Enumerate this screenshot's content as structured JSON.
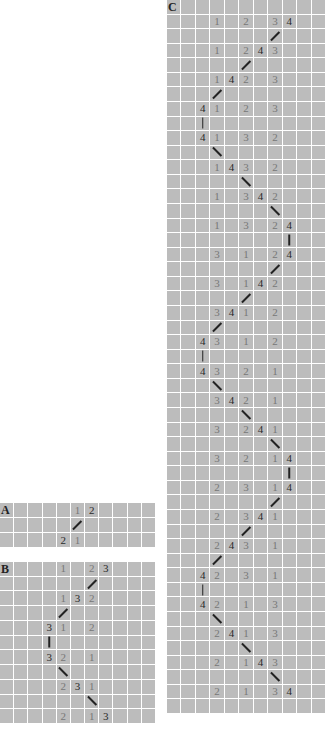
{
  "legend": {
    "dark_number_A": "2",
    "dark_number_B": "3",
    "dark_number_C": "4"
  },
  "colors": {
    "cell_background": "#bcbcbc",
    "grid_lines": "#ffffff",
    "light_number": "#777777",
    "dark_number": "#2a2a2a",
    "connector": "#222222"
  },
  "panels": [
    {
      "label": "A",
      "box": {
        "x": 0,
        "y": 503,
        "w": 155,
        "h": 44
      },
      "cols": 11,
      "dark": "2",
      "rows": [
        {
          "type": "numbers",
          "cells": {
            "5": "1",
            "6": "2"
          }
        },
        {
          "type": "connector",
          "col": 5,
          "dir": "up"
        },
        {
          "type": "numbers",
          "cells": {
            "4": "2",
            "5": "1"
          }
        }
      ]
    },
    {
      "label": "B",
      "box": {
        "x": 0,
        "y": 562,
        "w": 155,
        "h": 161
      },
      "cols": 11,
      "dark": "3",
      "rows": [
        {
          "type": "numbers",
          "cells": {
            "4": "1",
            "6": "2",
            "7": "3"
          }
        },
        {
          "type": "connector",
          "col": 6,
          "dir": "up"
        },
        {
          "type": "numbers",
          "cells": {
            "4": "1",
            "5": "3",
            "6": "2"
          }
        },
        {
          "type": "connector",
          "col": 4,
          "dir": "up"
        },
        {
          "type": "numbers",
          "cells": {
            "3": "3",
            "4": "1",
            "6": "2"
          }
        },
        {
          "type": "connector",
          "col": 3,
          "dir": "vert"
        },
        {
          "type": "numbers",
          "cells": {
            "3": "3",
            "4": "2",
            "6": "1"
          }
        },
        {
          "type": "connector",
          "col": 4,
          "dir": "down"
        },
        {
          "type": "numbers",
          "cells": {
            "4": "2",
            "5": "3",
            "6": "1"
          }
        },
        {
          "type": "connector",
          "col": 6,
          "dir": "down"
        },
        {
          "type": "numbers",
          "cells": {
            "4": "2",
            "6": "1",
            "7": "3"
          }
        }
      ]
    },
    {
      "label": "C",
      "box": {
        "x": 167,
        "y": 0,
        "w": 158,
        "h": 713
      },
      "cols": 11,
      "dark": "4",
      "rows": [
        {
          "type": "numbers",
          "cells": {
            "3": "1",
            "5": "2",
            "7": "3",
            "8": "4"
          }
        },
        {
          "type": "connector",
          "col": 7,
          "dir": "up"
        },
        {
          "type": "numbers",
          "cells": {
            "3": "1",
            "5": "2",
            "6": "4",
            "7": "3"
          }
        },
        {
          "type": "connector",
          "col": 5,
          "dir": "up"
        },
        {
          "type": "numbers",
          "cells": {
            "3": "1",
            "4": "4",
            "5": "2",
            "7": "3"
          }
        },
        {
          "type": "connector",
          "col": 3,
          "dir": "up"
        },
        {
          "type": "numbers",
          "cells": {
            "2": "4",
            "3": "1",
            "5": "2",
            "7": "3"
          }
        },
        {
          "type": "connector",
          "col": 2,
          "dir": "vert"
        },
        {
          "type": "numbers",
          "cells": {
            "2": "4",
            "3": "1",
            "5": "3",
            "7": "2"
          }
        },
        {
          "type": "connector",
          "col": 3,
          "dir": "down"
        },
        {
          "type": "numbers",
          "cells": {
            "3": "1",
            "4": "4",
            "5": "3",
            "7": "2"
          }
        },
        {
          "type": "connector",
          "col": 5,
          "dir": "down"
        },
        {
          "type": "numbers",
          "cells": {
            "3": "1",
            "5": "3",
            "6": "4",
            "7": "2"
          }
        },
        {
          "type": "connector",
          "col": 7,
          "dir": "down"
        },
        {
          "type": "numbers",
          "cells": {
            "3": "1",
            "5": "3",
            "7": "2",
            "8": "4"
          }
        },
        {
          "type": "connector",
          "col": 8,
          "dir": "vert"
        },
        {
          "type": "numbers",
          "cells": {
            "3": "3",
            "5": "1",
            "7": "2",
            "8": "4"
          }
        },
        {
          "type": "connector",
          "col": 7,
          "dir": "up"
        },
        {
          "type": "numbers",
          "cells": {
            "3": "3",
            "5": "1",
            "6": "4",
            "7": "2"
          }
        },
        {
          "type": "connector",
          "col": 5,
          "dir": "up"
        },
        {
          "type": "numbers",
          "cells": {
            "3": "3",
            "4": "4",
            "5": "1",
            "7": "2"
          }
        },
        {
          "type": "connector",
          "col": 3,
          "dir": "up"
        },
        {
          "type": "numbers",
          "cells": {
            "2": "4",
            "3": "3",
            "5": "1",
            "7": "2"
          }
        },
        {
          "type": "connector",
          "col": 2,
          "dir": "vert"
        },
        {
          "type": "numbers",
          "cells": {
            "2": "4",
            "3": "3",
            "5": "2",
            "7": "1"
          }
        },
        {
          "type": "connector",
          "col": 3,
          "dir": "down"
        },
        {
          "type": "numbers",
          "cells": {
            "3": "3",
            "4": "4",
            "5": "2",
            "7": "1"
          }
        },
        {
          "type": "connector",
          "col": 5,
          "dir": "down"
        },
        {
          "type": "numbers",
          "cells": {
            "3": "3",
            "5": "2",
            "6": "4",
            "7": "1"
          }
        },
        {
          "type": "connector",
          "col": 7,
          "dir": "down"
        },
        {
          "type": "numbers",
          "cells": {
            "3": "3",
            "5": "2",
            "7": "1",
            "8": "4"
          }
        },
        {
          "type": "connector",
          "col": 8,
          "dir": "vert"
        },
        {
          "type": "numbers",
          "cells": {
            "3": "2",
            "5": "3",
            "7": "1",
            "8": "4"
          }
        },
        {
          "type": "connector",
          "col": 7,
          "dir": "up"
        },
        {
          "type": "numbers",
          "cells": {
            "3": "2",
            "5": "3",
            "6": "4",
            "7": "1"
          }
        },
        {
          "type": "connector",
          "col": 5,
          "dir": "up"
        },
        {
          "type": "numbers",
          "cells": {
            "3": "2",
            "4": "4",
            "5": "3",
            "7": "1"
          }
        },
        {
          "type": "connector",
          "col": 3,
          "dir": "up"
        },
        {
          "type": "numbers",
          "cells": {
            "2": "4",
            "3": "2",
            "5": "3",
            "7": "1"
          }
        },
        {
          "type": "connector",
          "col": 2,
          "dir": "vert"
        },
        {
          "type": "numbers",
          "cells": {
            "2": "4",
            "3": "2",
            "5": "1",
            "7": "3"
          }
        },
        {
          "type": "connector",
          "col": 3,
          "dir": "down"
        },
        {
          "type": "numbers",
          "cells": {
            "3": "2",
            "4": "4",
            "5": "1",
            "7": "3"
          }
        },
        {
          "type": "connector",
          "col": 5,
          "dir": "down"
        },
        {
          "type": "numbers",
          "cells": {
            "3": "2",
            "5": "1",
            "6": "4",
            "7": "3"
          }
        },
        {
          "type": "connector",
          "col": 7,
          "dir": "down"
        },
        {
          "type": "numbers",
          "cells": {
            "3": "2",
            "5": "1",
            "7": "3",
            "8": "4"
          }
        },
        {
          "type": "empty"
        }
      ]
    }
  ]
}
